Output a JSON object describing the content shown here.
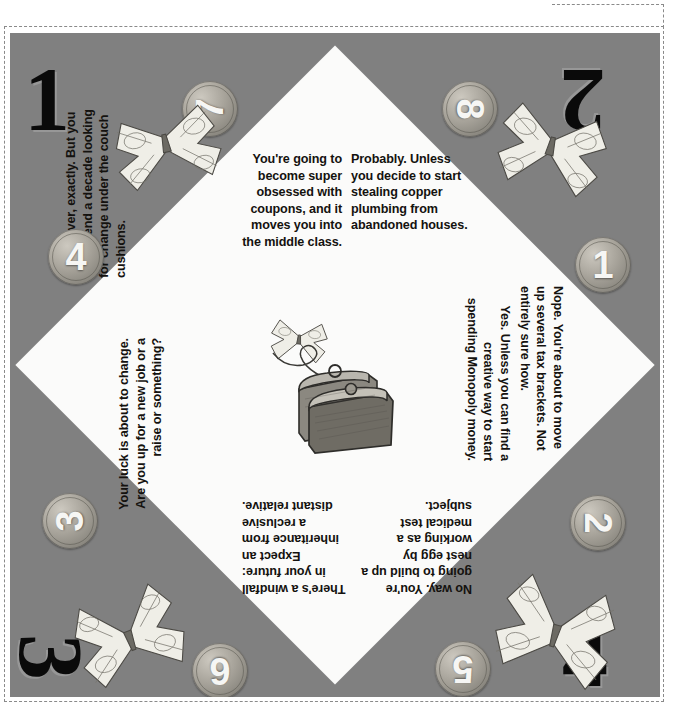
{
  "page": {
    "background_color": "#ffffff",
    "sheet_color": "#808080",
    "diamond_color": "#fbfbfa",
    "text_color": "#14120f"
  },
  "fortunes": [
    {
      "id": "top-left",
      "position": "top-left",
      "orientation": "upright",
      "text": "You're going to become super obsessed with coupons, and it moves you into the middle class."
    },
    {
      "id": "top-right",
      "position": "top-right",
      "orientation": "upright",
      "text": "Probably. Unless you decide to start stealing copper plumbing from abandoned houses."
    },
    {
      "id": "left-top",
      "position": "left-top",
      "orientation": "rotated-90-ccw",
      "text": "Not forever, exactly. But you may spend a decade looking for change under the couch cushions."
    },
    {
      "id": "left-bottom",
      "position": "left-bottom",
      "orientation": "rotated-90-ccw",
      "text": "Your luck is about to change. Are you up for a new job or a raise or something?"
    },
    {
      "id": "right-top",
      "position": "right-top",
      "orientation": "rotated-90-cw",
      "text": "Yes. Unless you can find a creative way to start spending Monopoly money."
    },
    {
      "id": "right-bottom",
      "position": "right-bottom",
      "orientation": "rotated-90-cw",
      "text": "Nope. You're about to move up several tax brackets. Not entirely sure how."
    },
    {
      "id": "bottom-left",
      "position": "bottom-left",
      "orientation": "rotated-180",
      "text": "There's a windfall in your future: Expect an inheritance from a reclusive distant relative."
    },
    {
      "id": "bottom-right",
      "position": "bottom-right",
      "orientation": "rotated-180",
      "text": "No way. You're going to build up a nest egg by working as a medical test subject."
    }
  ],
  "corner_numerals": [
    {
      "id": "corner-1",
      "label": "1",
      "corner": "top-left",
      "orientation": "upright"
    },
    {
      "id": "corner-2",
      "label": "2",
      "corner": "top-right",
      "orientation": "rotated-180"
    },
    {
      "id": "corner-3",
      "label": "3",
      "corner": "bottom-left",
      "orientation": "rotated-90-cw"
    },
    {
      "id": "corner-4",
      "label": "4",
      "corner": "bottom-right",
      "orientation": "upright"
    }
  ],
  "coins": [
    {
      "id": "coin-7",
      "label": "7",
      "edge": "top-left",
      "orientation": "rotated-90-ccw"
    },
    {
      "id": "coin-8",
      "label": "8",
      "edge": "top-right",
      "orientation": "rotated-90-cw"
    },
    {
      "id": "coin-4",
      "label": "4",
      "edge": "left-upper",
      "orientation": "upright"
    },
    {
      "id": "coin-1",
      "label": "1",
      "edge": "right-upper",
      "orientation": "upright"
    },
    {
      "id": "coin-3",
      "label": "3",
      "edge": "left-lower",
      "orientation": "rotated-90-ccw"
    },
    {
      "id": "coin-2",
      "label": "2",
      "edge": "right-lower",
      "orientation": "rotated-90-cw"
    },
    {
      "id": "coin-6",
      "label": "6",
      "edge": "bottom-left",
      "orientation": "rotated-180"
    },
    {
      "id": "coin-5",
      "label": "5",
      "edge": "bottom-right",
      "orientation": "rotated-180"
    }
  ],
  "illustrations": [
    {
      "id": "butterfly-top-left",
      "name": "dollar-bill-butterfly-icon"
    },
    {
      "id": "butterfly-top-right",
      "name": "dollar-bill-butterfly-icon"
    },
    {
      "id": "butterfly-bottom-left",
      "name": "dollar-bill-butterfly-icon"
    },
    {
      "id": "butterfly-bottom-right",
      "name": "dollar-bill-butterfly-icon"
    },
    {
      "id": "butterfly-center",
      "name": "dollar-bill-butterfly-icon"
    },
    {
      "id": "coin-purse",
      "name": "coin-purse-icon"
    }
  ]
}
